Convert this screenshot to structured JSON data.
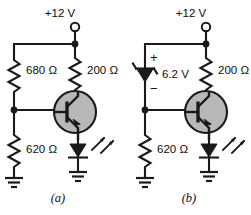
{
  "figure": {
    "background_color": "#ffffff",
    "line_color": "#1a1a1a",
    "transistor_fill_color": "#b8b8b8"
  },
  "circuits": [
    {
      "id": "a",
      "caption": "(a)",
      "supply_label": "+12 V",
      "components": [
        {
          "name": "base-resistor-upper",
          "type": "resistor",
          "label": "680 Ω"
        },
        {
          "name": "collector-resistor",
          "type": "resistor",
          "label": "200 Ω"
        },
        {
          "name": "base-resistor-lower",
          "type": "resistor",
          "label": "620 Ω"
        },
        {
          "name": "transistor",
          "type": "npn-transistor",
          "label": ""
        },
        {
          "name": "led",
          "type": "led",
          "label": ""
        },
        {
          "name": "ground-left",
          "type": "ground",
          "label": ""
        },
        {
          "name": "ground-right",
          "type": "ground",
          "label": ""
        }
      ]
    },
    {
      "id": "b",
      "caption": "(b)",
      "supply_label": "+12 V",
      "components": [
        {
          "name": "zener-diode",
          "type": "zener-diode",
          "label": "6.2 V",
          "plus_sign": "+",
          "minus_sign": "−"
        },
        {
          "name": "collector-resistor",
          "type": "resistor",
          "label": "200 Ω"
        },
        {
          "name": "emitter-resistor",
          "type": "resistor",
          "label": "620 Ω"
        },
        {
          "name": "transistor",
          "type": "npn-transistor",
          "label": ""
        },
        {
          "name": "led",
          "type": "led",
          "label": ""
        },
        {
          "name": "ground-left",
          "type": "ground",
          "label": ""
        },
        {
          "name": "ground-right",
          "type": "ground",
          "label": ""
        }
      ]
    }
  ],
  "labels": {
    "a_supply": "+12 V",
    "a_r680": "680 Ω",
    "a_r200": "200 Ω",
    "a_r620": "620 Ω",
    "a_caption": "(a)",
    "b_supply": "+12 V",
    "b_zener": "6.2 V",
    "b_plus": "+",
    "b_minus": "−",
    "b_r200": "200 Ω",
    "b_r620": "620 Ω",
    "b_caption": "(b)"
  }
}
